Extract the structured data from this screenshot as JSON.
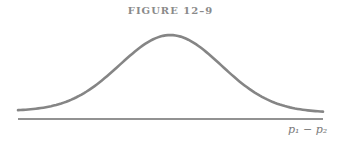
{
  "chart_data": {
    "type": "line",
    "title": "FIGURE 12–9",
    "xlabel": "p1 − p2",
    "ylabel": "",
    "series": [
      {
        "name": "normal density",
        "x": [
          -3,
          -2.5,
          -2,
          -1.5,
          -1,
          -0.5,
          0,
          0.5,
          1,
          1.5,
          2,
          2.5,
          3
        ],
        "values": [
          0.004,
          0.018,
          0.054,
          0.13,
          0.242,
          0.352,
          0.399,
          0.352,
          0.242,
          0.13,
          0.054,
          0.018,
          0.004
        ]
      }
    ],
    "grid": false,
    "legend": "none"
  },
  "figure": {
    "title": "FIGURE 12–9",
    "axis_label": "p₁ − p₂",
    "colors": {
      "curve": "#858585",
      "axis": "#6e6e6e",
      "title": "#8a8a8a"
    }
  }
}
